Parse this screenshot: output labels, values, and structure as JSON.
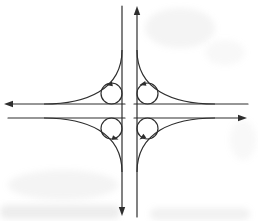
{
  "figure": {
    "name": "cloverleaf-interchange-diagram",
    "canvas": {
      "width": 258,
      "height": 221
    },
    "colors": {
      "background": "#ffffff",
      "line": "#2e2e2e"
    },
    "stroke_width": 1.2,
    "arrow_sizes": {
      "road": {
        "length": 9,
        "half_width": 3.2
      },
      "loop": {
        "length": 6.5,
        "half_width": 2.4
      }
    },
    "road_lines": [
      {
        "name": "southbound-carriageway",
        "x1": 122,
        "y1": 6,
        "x2": 122,
        "y2": 209,
        "arrow": {
          "tip": [
            122,
            216
          ],
          "angle": 90
        }
      },
      {
        "name": "northbound-carriageway",
        "x1": 137,
        "y1": 217,
        "x2": 137,
        "y2": 12,
        "arrow": {
          "tip": [
            137,
            6
          ],
          "angle": 270
        }
      },
      {
        "name": "westbound-carriageway-east-half",
        "x1": 248,
        "y1": 104,
        "x2": 134,
        "y2": 104,
        "arrow": null
      },
      {
        "name": "westbound-carriageway-west-half",
        "x1": 125,
        "y1": 104,
        "x2": 10,
        "y2": 104,
        "arrow": {
          "tip": [
            4,
            104
          ],
          "angle": 180
        }
      },
      {
        "name": "eastbound-carriageway-west-half",
        "x1": 8,
        "y1": 118,
        "x2": 125,
        "y2": 118,
        "arrow": null
      },
      {
        "name": "eastbound-carriageway-east-half",
        "x1": 134,
        "y1": 118,
        "x2": 240,
        "y2": 118,
        "arrow": {
          "tip": [
            247,
            118
          ],
          "angle": 0
        }
      }
    ],
    "outer_ramps": [
      {
        "name": "northwest-ramp",
        "path": "M 122 50 C 122 90, 86 104, 44 104"
      },
      {
        "name": "northeast-ramp",
        "path": "M 137 50 C 137 90, 173 104, 215 104"
      },
      {
        "name": "southwest-ramp",
        "path": "M 122 172 C 122 132, 86 118, 44 118"
      },
      {
        "name": "southeast-ramp",
        "path": "M 137 172 C 137 132, 173 118, 215 118"
      }
    ],
    "loop_ramps": [
      {
        "name": "northwest-loop",
        "cx": 111.5,
        "cy": 93.5,
        "r": 10.5,
        "arrow": {
          "tip": [
            106,
            85
          ],
          "angle": 170
        }
      },
      {
        "name": "northeast-loop",
        "cx": 147.5,
        "cy": 93.5,
        "r": 10.5,
        "arrow": {
          "tip": [
            139.5,
            85
          ],
          "angle": 165
        }
      },
      {
        "name": "southwest-loop",
        "cx": 111.5,
        "cy": 128.5,
        "r": 10.5,
        "arrow": {
          "tip": [
            118.5,
            139.5
          ],
          "angle": 18
        }
      },
      {
        "name": "southeast-loop",
        "cx": 147.5,
        "cy": 128.5,
        "r": 10.5,
        "arrow": {
          "tip": [
            139.5,
            139.5
          ],
          "angle": 145
        }
      }
    ]
  }
}
